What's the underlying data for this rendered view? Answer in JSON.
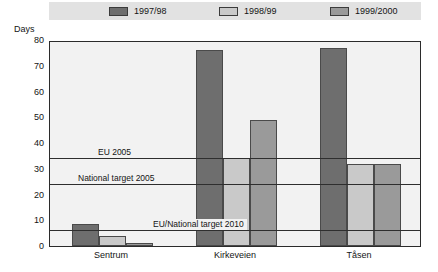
{
  "chart_data": {
    "type": "bar",
    "title": "",
    "subtitle": "",
    "xlabel": "",
    "ylabel": "Days",
    "ylim": [
      0,
      80
    ],
    "yticks": [
      0,
      10,
      20,
      30,
      40,
      50,
      60,
      70,
      80
    ],
    "ytick_labels": [
      "0",
      "10",
      "20",
      "30",
      "40",
      "50",
      "60",
      "70",
      "80"
    ],
    "grid": false,
    "legend_position": "top",
    "categories": [
      "Sentrum",
      "Kirkeveien",
      "Tåsen"
    ],
    "series": [
      {
        "name": "1997/98",
        "color": "#6e6e6e",
        "values": [
          8.5,
          76,
          77
        ]
      },
      {
        "name": "1998/99",
        "color": "#c9c9c9",
        "values": [
          4,
          34,
          32
        ]
      },
      {
        "name": "1999/2000",
        "color": "#9a9a9a",
        "values": [
          1,
          49,
          32
        ]
      }
    ],
    "annotations": [
      {
        "label": "EU 2005",
        "value": 35
      },
      {
        "label": "National target 2005",
        "value": 25
      },
      {
        "label": "EU/National target 2010",
        "value": 7
      }
    ]
  },
  "legend": {
    "items": [
      {
        "label": "1997/98"
      },
      {
        "label": "1998/99"
      },
      {
        "label": "1999/2000"
      }
    ]
  },
  "axis": {
    "y_title": "Days"
  },
  "colors": {
    "legend_background": "#e2e2e2",
    "plot_background": "#f2f2f2",
    "frame": "#2b2b2b",
    "series_1997_98": "#6e6e6e",
    "series_1998_99": "#c9c9c9",
    "series_1999_2000": "#9a9a9a"
  }
}
